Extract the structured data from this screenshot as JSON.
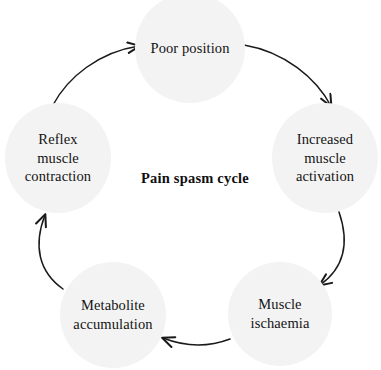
{
  "diagram": {
    "title": "Pain spasm cycle",
    "center_label": "Pain spasm cycle",
    "background_color": "#ffffff",
    "node_fill_color": "#f3f3f3",
    "text_color": "#141414",
    "arrow_color": "#1a1a1a",
    "nodes": [
      {
        "id": "poor-position",
        "label": "Poor position",
        "position": "top"
      },
      {
        "id": "increased-muscle-activation",
        "label": "Increased\nmuscle\nactivation",
        "position": "right"
      },
      {
        "id": "muscle-ischaemia",
        "label": "Muscle\nischaemia",
        "position": "bottom-right"
      },
      {
        "id": "metabolite-accumulation",
        "label": "Metabolite\naccumulation",
        "position": "bottom-left"
      },
      {
        "id": "reflex-muscle-contraction",
        "label": "Reflex\nmuscle\ncontraction",
        "position": "left"
      }
    ],
    "arrows": [
      {
        "id": "arrow-poor-position-to-increased-muscle-activation",
        "from": "poor-position",
        "to": "increased-muscle-activation"
      },
      {
        "id": "arrow-increased-muscle-activation-to-muscle-ischaemia",
        "from": "increased-muscle-activation",
        "to": "muscle-ischaemia"
      },
      {
        "id": "arrow-muscle-ischaemia-to-metabolite-accumulation",
        "from": "muscle-ischaemia",
        "to": "metabolite-accumulation"
      },
      {
        "id": "arrow-metabolite-accumulation-to-reflex-muscle-contraction",
        "from": "metabolite-accumulation",
        "to": "reflex-muscle-contraction"
      },
      {
        "id": "arrow-reflex-muscle-contraction-to-poor-position",
        "from": "reflex-muscle-contraction",
        "to": "poor-position"
      }
    ]
  }
}
